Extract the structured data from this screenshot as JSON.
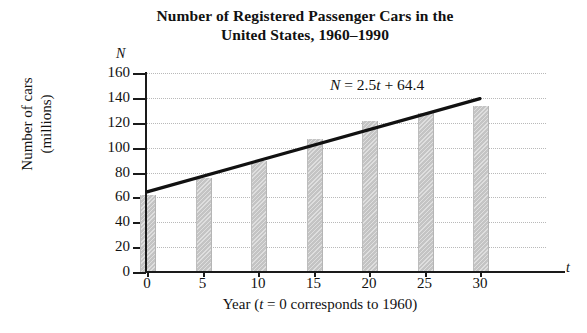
{
  "chart_data": {
    "type": "bar",
    "title": "Number of Registered Passenger Cars in the United States, 1960–1990",
    "title_line1": "Number of Registered Passenger Cars in the",
    "title_line2": "United States, 1960–1990",
    "xlabel": "Year (t = 0 corresponds to 1960)",
    "xlabel_prefix": "Year (",
    "xlabel_var": "t",
    "xlabel_suffix": " = 0 corresponds to 1960)",
    "ylabel": "Number of cars (millions)",
    "ylabel_line1": "Number of cars",
    "ylabel_line2": "(millions)",
    "x_axis_symbol": "t",
    "y_axis_symbol": "N",
    "categories": [
      0,
      5,
      10,
      15,
      20,
      25,
      30
    ],
    "xtick_labels": [
      "0",
      "5",
      "10",
      "15",
      "20",
      "25",
      "30"
    ],
    "ytick_labels": [
      "0",
      "20",
      "40",
      "60",
      "80",
      "100",
      "120",
      "140",
      "160"
    ],
    "yticks": [
      0,
      20,
      40,
      60,
      80,
      100,
      120,
      140,
      160
    ],
    "values": [
      61.7,
      75.3,
      89.2,
      106.7,
      121.6,
      127.9,
      133.7
    ],
    "xlim": [
      -2.5,
      33
    ],
    "ylim": [
      0,
      160
    ],
    "grid": "horizontal-dotted",
    "legend": "none",
    "bar_color": "#c4c4c4",
    "line_color": "#111111",
    "annotation": {
      "text": "N = 2.5t + 64.4",
      "var_n": "N",
      "equals": " = 2.5",
      "var_t": "t",
      "rest": " + 64.4"
    },
    "series": [
      {
        "name": "Registered passenger cars (millions)",
        "type": "bar",
        "values": [
          61.7,
          75.3,
          89.2,
          106.7,
          121.6,
          127.9,
          133.7
        ]
      },
      {
        "name": "N = 2.5t + 64.4",
        "type": "line",
        "slope": 2.5,
        "intercept": 64.4,
        "x": [
          0,
          30
        ],
        "values": [
          64.4,
          139.4
        ]
      }
    ]
  }
}
